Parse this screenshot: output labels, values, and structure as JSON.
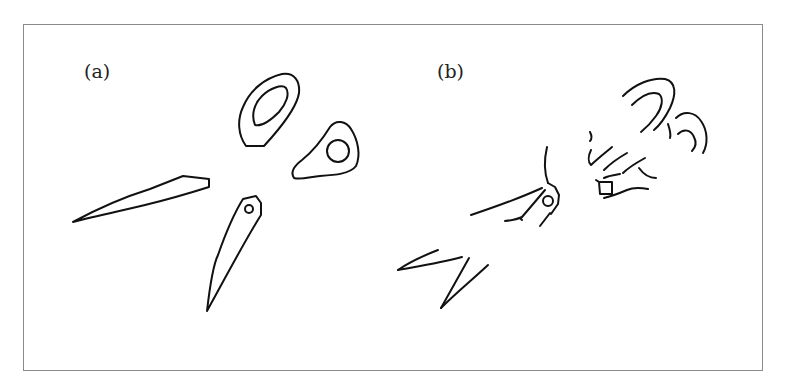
{
  "figure": {
    "panels": [
      {
        "label": "(a)",
        "description": "Scissors drawn as separate disjoint parts: two blades and two finger-ring handles",
        "parts": [
          "blade-left",
          "blade-lower-with-pivot-hole",
          "ring-handle-large",
          "ring-handle-small"
        ]
      },
      {
        "label": "(b)",
        "description": "Scissors drawn as fragmented broken contours: partial arcs of handles, pivot with hole, and open blade strokes",
        "parts": [
          "handle-arc-fragments",
          "pivot-with-hole",
          "blade-stroke-fragments"
        ]
      }
    ],
    "colors": {
      "line": "#111111",
      "frame": "#8a8a8a",
      "background": "#ffffff"
    }
  }
}
